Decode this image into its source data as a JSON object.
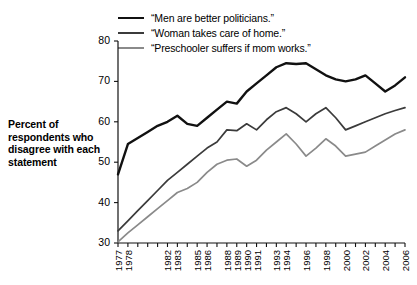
{
  "chart_data": {
    "type": "line",
    "title": "",
    "xlabel": "",
    "ylabel": "Percent of respondents who disagree with each statement",
    "ylim": [
      30,
      80
    ],
    "yticks": [
      30,
      40,
      50,
      60,
      70,
      80
    ],
    "grid": false,
    "legend_position": "top",
    "x": [
      1977,
      1978,
      1979,
      1980,
      1981,
      1982,
      1983,
      1984,
      1985,
      1986,
      1987,
      1988,
      1989,
      1990,
      1991,
      1992,
      1993,
      1994,
      1995,
      1996,
      1997,
      1998,
      1999,
      2000,
      2001,
      2002,
      2003,
      2004,
      2005,
      2006
    ],
    "xtick_labels": [
      "1977",
      "1978",
      "",
      "",
      "",
      "1982",
      "1983",
      "",
      "1985",
      "1986",
      "",
      "1988",
      "1989",
      "1990",
      "1991",
      "",
      "1993",
      "1994",
      "",
      "1996",
      "",
      "1998",
      "",
      "2000",
      "",
      "2002",
      "",
      "2004",
      "",
      "2006"
    ],
    "series": [
      {
        "name": "“Men are better politicians.”",
        "color": "#111111",
        "width": 2.4,
        "values": [
          47.0,
          54.5,
          56.0,
          57.5,
          59.0,
          60.0,
          61.5,
          59.5,
          59.0,
          61.0,
          63.0,
          65.0,
          64.5,
          67.5,
          69.5,
          71.5,
          73.5,
          74.5,
          74.3,
          74.5,
          73.0,
          71.5,
          70.5,
          70.0,
          70.5,
          71.5,
          69.5,
          67.5,
          69.0,
          71.0
        ]
      },
      {
        "name": "“Woman takes care of home.”",
        "color": "#3b3b3b",
        "width": 1.7,
        "values": [
          33.0,
          35.5,
          38.0,
          40.5,
          43.0,
          45.5,
          47.5,
          49.5,
          51.5,
          53.5,
          55.0,
          58.0,
          57.8,
          59.5,
          58.0,
          60.5,
          62.5,
          63.5,
          62.0,
          60.0,
          62.0,
          63.5,
          61.0,
          58.0,
          59.0,
          60.0,
          61.0,
          62.0,
          62.8,
          63.5
        ]
      },
      {
        "name": "“Preschooler suffers if mom works.”",
        "color": "#8a8a8a",
        "width": 1.7,
        "values": [
          30.3,
          32.5,
          34.5,
          36.5,
          38.5,
          40.5,
          42.5,
          43.5,
          45.0,
          47.5,
          49.5,
          50.5,
          50.8,
          49.0,
          50.5,
          53.0,
          55.0,
          57.0,
          54.5,
          51.5,
          53.5,
          55.8,
          54.0,
          51.5,
          52.0,
          52.5,
          54.0,
          55.5,
          57.0,
          58.0
        ]
      }
    ]
  },
  "axis_title_text": "Percent of respondents who disagree with each statement"
}
